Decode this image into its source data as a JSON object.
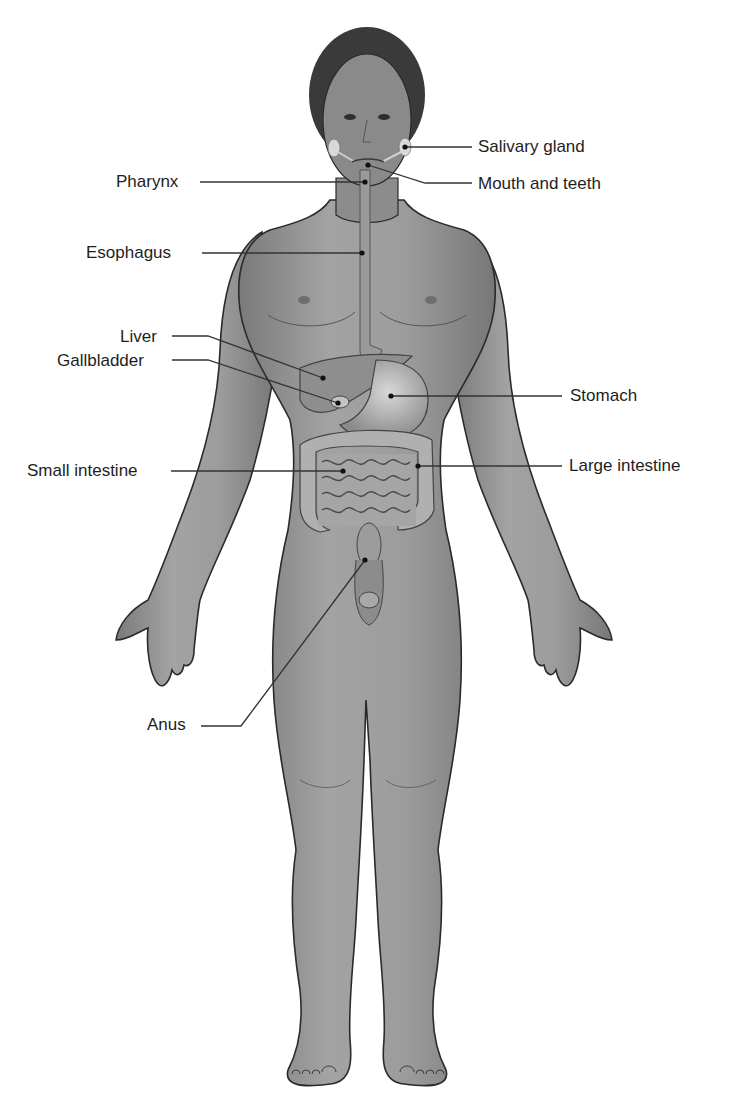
{
  "diagram": {
    "colors": {
      "background": "#ffffff",
      "skin": "#8f8f8f",
      "skin_light": "#b4b4b4",
      "skin_dark": "#6a6a6a",
      "outline": "#2a2a2a",
      "hair": "#3a3a3a",
      "organ": "#9e9e9e",
      "organ_light": "#c8c8c8",
      "leader_line": "#333333",
      "text": "#1e1e1e"
    },
    "labels": [
      {
        "id": "salivary-gland",
        "text": "Salivary gland",
        "side": "right",
        "x": 478,
        "y": 137,
        "line": [
          [
            472,
            147
          ],
          [
            405,
            147
          ]
        ],
        "dot": [
          405,
          147
        ]
      },
      {
        "id": "mouth-and-teeth",
        "text": "Mouth and teeth",
        "side": "right",
        "x": 478,
        "y": 174,
        "line": [
          [
            472,
            183
          ],
          [
            425,
            183
          ],
          [
            368,
            165
          ]
        ],
        "dot": [
          368,
          165
        ]
      },
      {
        "id": "pharynx",
        "text": "Pharynx",
        "side": "left",
        "x": 116,
        "y": 172,
        "line": [
          [
            200,
            182
          ],
          [
            365,
            182
          ]
        ],
        "dot": [
          365,
          182
        ]
      },
      {
        "id": "esophagus",
        "text": "Esophagus",
        "side": "left",
        "x": 86,
        "y": 243,
        "line": [
          [
            202,
            253
          ],
          [
            362,
            253
          ]
        ],
        "dot": [
          362,
          253
        ]
      },
      {
        "id": "liver",
        "text": "Liver",
        "side": "left",
        "x": 120,
        "y": 327,
        "line": [
          [
            172,
            336
          ],
          [
            208,
            336
          ],
          [
            323,
            378
          ]
        ],
        "dot": [
          323,
          378
        ]
      },
      {
        "id": "gallbladder",
        "text": "Gallbladder",
        "side": "left",
        "x": 57,
        "y": 351,
        "line": [
          [
            172,
            360
          ],
          [
            208,
            360
          ],
          [
            338,
            403
          ]
        ],
        "dot": [
          338,
          403
        ]
      },
      {
        "id": "stomach",
        "text": "Stomach",
        "side": "right",
        "x": 570,
        "y": 386,
        "line": [
          [
            562,
            396
          ],
          [
            391,
            396
          ]
        ],
        "dot": [
          391,
          396
        ]
      },
      {
        "id": "small-intestine",
        "text": "Small intestine",
        "side": "left",
        "x": 27,
        "y": 461,
        "line": [
          [
            171,
            471
          ],
          [
            343,
            471
          ]
        ],
        "dot": [
          343,
          471
        ]
      },
      {
        "id": "large-intestine",
        "text": "Large intestine",
        "side": "right",
        "x": 569,
        "y": 456,
        "line": [
          [
            562,
            466
          ],
          [
            418,
            466
          ]
        ],
        "dot": [
          418,
          466
        ]
      },
      {
        "id": "anus",
        "text": "Anus",
        "side": "left",
        "x": 147,
        "y": 715,
        "line": [
          [
            201,
            726
          ],
          [
            241,
            726
          ],
          [
            365,
            560
          ]
        ],
        "dot": [
          365,
          560
        ]
      }
    ]
  }
}
